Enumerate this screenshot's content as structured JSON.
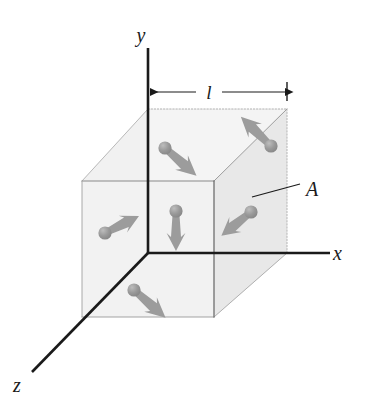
{
  "figure": {
    "background_color": "#ffffff"
  },
  "axes": {
    "color": "#1a1a1a",
    "stroke_width": 2.6,
    "origin": {
      "x": 148,
      "y": 253
    },
    "items": [
      {
        "name": "y-axis",
        "label": "y",
        "label_x": 141,
        "label_y": 42,
        "x1": 148,
        "y1": 48,
        "x2": 148,
        "y2": 253
      },
      {
        "name": "x-axis",
        "label": "x",
        "label_x": 333,
        "label_y": 260,
        "x1": 148,
        "y1": 253,
        "x2": 330,
        "y2": 253
      },
      {
        "name": "z-axis",
        "label": "z",
        "label_x": 13,
        "label_y": 392,
        "x1": 148,
        "y1": 253,
        "x2": 32,
        "y2": 372
      }
    ]
  },
  "dimension": {
    "label": "l",
    "label_x": 210,
    "label_y": 98,
    "line_y": 92,
    "x_start": 150,
    "x_end": 286,
    "tick_x": 287,
    "tick_y1": 82,
    "tick_y2": 101,
    "color": "#1a1a1a"
  },
  "annotation": {
    "label": "A",
    "label_x": 306,
    "label_y": 196,
    "leader_x1": 252,
    "leader_y1": 197,
    "leader_x2": 300,
    "leader_y2": 184,
    "color": "#1a1a1a"
  },
  "cube": {
    "front_face": {
      "x": 82,
      "y": 181,
      "width": 132,
      "height": 136
    },
    "depth_dx": 73,
    "depth_dy": -72,
    "face_fill": "#f2f2f2",
    "shaded_face_fill": "#e9e9e9",
    "solid_edge_color": "#777777",
    "dotted_edge_color": "#aaaaaa",
    "bold_edge_color": "#2a2a2a",
    "vertices": {
      "front_top_left": {
        "x": 82,
        "y": 181
      },
      "front_top_right": {
        "x": 214,
        "y": 181
      },
      "front_bottom_left": {
        "x": 82,
        "y": 317
      },
      "front_bottom_right": {
        "x": 214,
        "y": 317
      },
      "back_top_left": {
        "x": 148,
        "y": 109
      },
      "back_top_right": {
        "x": 287,
        "y": 109
      },
      "back_bottom_left": {
        "x": 148,
        "y": 253
      },
      "back_bottom_right": {
        "x": 287,
        "y": 253
      }
    }
  },
  "molecules": {
    "ball_color": "#909090",
    "ball_highlight_color": "#b8b8b8",
    "arrow_color": "#9a9a9a",
    "ball_radius": 6.5,
    "count": 6,
    "items": [
      {
        "name": "molecule-top-center",
        "ball_x": 165,
        "ball_y": 148,
        "tip_x": 199,
        "tip_y": 178
      },
      {
        "name": "molecule-top-right",
        "ball_x": 271,
        "ball_y": 146,
        "tip_x": 241,
        "tip_y": 117
      },
      {
        "name": "molecule-left",
        "ball_x": 105,
        "ball_y": 233,
        "tip_x": 139,
        "tip_y": 216
      },
      {
        "name": "molecule-center",
        "ball_x": 176,
        "ball_y": 211,
        "tip_x": 176,
        "tip_y": 251
      },
      {
        "name": "molecule-right",
        "ball_x": 251,
        "ball_y": 212,
        "tip_x": 221,
        "tip_y": 236
      },
      {
        "name": "molecule-bottom",
        "ball_x": 134,
        "ball_y": 290,
        "tip_x": 167,
        "tip_y": 319
      }
    ]
  }
}
